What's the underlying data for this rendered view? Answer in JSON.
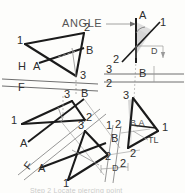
{
  "drawing": {
    "title": "ANGLE",
    "subject": "descriptive-geometry-line-and-plane-angle",
    "colors": {
      "object_line": "#1b1b1b",
      "thin_line": "#8a8a8a",
      "hidden_line": "#7a7a7a",
      "fold_line": "#6f6f6f",
      "shade_fill": "#d8d8d8",
      "paper": "#fdfdfb",
      "text": "#2e2e2e"
    },
    "callouts": {
      "angle_label": "ANGLE",
      "true_length_label": "TL",
      "depth_dim_top": "D",
      "depth_dim_bottom": "D"
    },
    "views": {
      "horizontal_view": {
        "name": "Horizontal (top) view",
        "vertex_labels": [
          "1",
          "2",
          "3"
        ],
        "point_labels": [
          "A",
          "B"
        ]
      },
      "frontal_view": {
        "name": "Frontal view",
        "vertex_labels": [
          "1",
          "2",
          "3"
        ],
        "point_labels": [
          "A",
          "B"
        ]
      },
      "auxiliary_view_1": {
        "name": "First auxiliary (edge view of plane)",
        "vertex_labels": [
          "1",
          "2",
          "3"
        ],
        "point_labels": [
          "A",
          "B"
        ]
      },
      "auxiliary_view_2": {
        "name": "Second auxiliary (true size / angle view)",
        "vertex_labels": [
          "1",
          "2",
          "3"
        ],
        "point_labels": [
          "A",
          "B"
        ],
        "combined_point_label": "B,A"
      }
    },
    "fold_lines": [
      {
        "id": "h-f",
        "upper": "H",
        "lower": "F"
      },
      {
        "id": "f-1-left",
        "upper": "F",
        "lower": "1"
      },
      {
        "id": "1-2-bottom",
        "left": "1",
        "right": "2"
      },
      {
        "id": "3-2-right",
        "upper": "3",
        "lower": "2"
      }
    ],
    "labels": {
      "hv_v1": "1",
      "hv_v2": "2",
      "hv_v3": "3",
      "hv_A": "A",
      "hv_B": "B",
      "fold_H": "H",
      "fold_F": "F",
      "mv_v1": "1",
      "mv_v2": "2",
      "mv_v3": "3",
      "mv_A": "A",
      "mv_B": "B",
      "fold_F2": "F",
      "fold_1_left": "1",
      "fold_A_lower": "A",
      "bc_v1": "1",
      "bc_v2": "2",
      "bc_v3": "3",
      "bc_B": "B",
      "bc_fold_1": "1",
      "bc_fold_2": "2",
      "bc_fold_2b": "2",
      "br_v1": "1",
      "br_v2": "2",
      "br_v3": "3",
      "br_BA": "B,A",
      "ang_A": "A",
      "ang_1": "1",
      "ang_2": "2",
      "ang_B": "B",
      "ang_fold_3": "3",
      "ang_fold_2": "2"
    },
    "footer_text": "Step 2 Locate piercing point"
  }
}
